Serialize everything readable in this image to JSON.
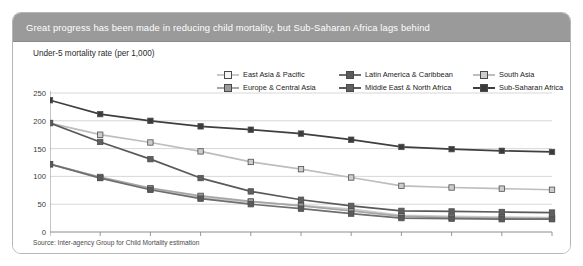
{
  "banner": {
    "title": "Great progress has been made in reducing child mortality, but Sub-Saharan Africa lags behind"
  },
  "source": {
    "text": "Source: Inter-agency Group for Child Mortality estimation"
  },
  "chart_data": {
    "type": "line",
    "title": "Great progress has been made in reducing child mortality, but Sub-Saharan Africa lags behind",
    "subtitle": "Under-5 mortality rate (per 1,000)",
    "xlabel": "",
    "ylabel": "Under-5 mortality rate (per 1,000)",
    "ylim": [
      0,
      250
    ],
    "yticks": [
      0,
      50,
      100,
      150,
      200,
      250
    ],
    "grid": true,
    "legend_position": "top",
    "categories": [
      "1970",
      "1975",
      "1980",
      "1985",
      "1990",
      "1995",
      "2000",
      "2005",
      "2006",
      "2007",
      "2008"
    ],
    "series": [
      {
        "name": "East Asia & Pacific",
        "color": "#efefef",
        "marker_fill": "#f4f4f4",
        "line_color": "#c9c9c9",
        "values": [
          122,
          98,
          77,
          62,
          54,
          48,
          41,
          30,
          28,
          27,
          26
        ]
      },
      {
        "name": "Europe & Central Asia",
        "color": "#9a9a9a",
        "marker_fill": "#9a9a9a",
        "line_color": "#a6a6a6",
        "values": [
          122,
          99,
          79,
          65,
          55,
          47,
          38,
          28,
          26,
          25,
          24
        ]
      },
      {
        "name": "Latin America & Caribbean",
        "color": "#555555",
        "marker_fill": "#5a5a5a",
        "line_color": "#6e6e6e",
        "values": [
          122,
          97,
          76,
          60,
          50,
          42,
          33,
          25,
          24,
          23,
          23
        ]
      },
      {
        "name": "Middle East & North Africa",
        "color": "#6b6b6b",
        "marker_fill": "#5f5f5f",
        "line_color": "#5a5a5a",
        "values": [
          196,
          162,
          131,
          97,
          73,
          58,
          47,
          38,
          37,
          36,
          35
        ]
      },
      {
        "name": "South Asia",
        "color": "#c4c4c4",
        "marker_fill": "#cdcdcd",
        "line_color": "#bdbdbd",
        "values": [
          196,
          175,
          161,
          145,
          126,
          113,
          98,
          83,
          80,
          78,
          76
        ]
      },
      {
        "name": "Sub-Saharan Africa",
        "color": "#3b3b3b",
        "marker_fill": "#3b3b3b",
        "line_color": "#3f3f3f",
        "values": [
          237,
          212,
          200,
          190,
          184,
          177,
          166,
          153,
          149,
          146,
          144
        ]
      }
    ]
  }
}
